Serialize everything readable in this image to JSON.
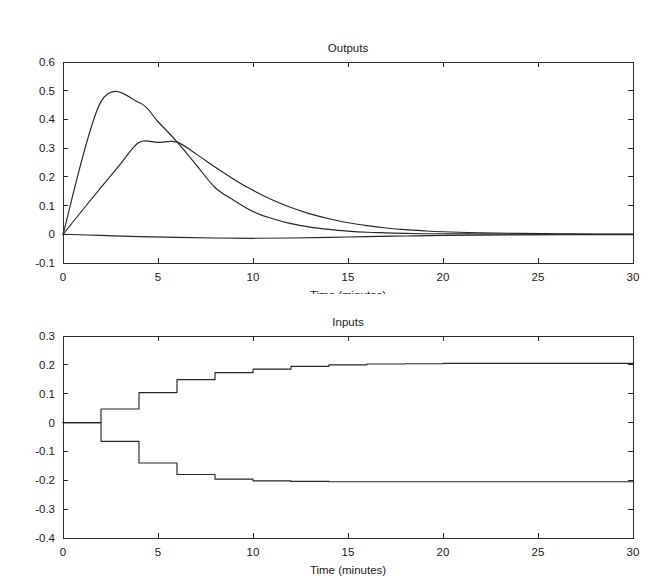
{
  "figure": {
    "width": 669,
    "height": 588,
    "background": "#ffffff",
    "line_color": "#262626",
    "axis_color": "#2a2a2a"
  },
  "chart_data": [
    {
      "type": "line",
      "id": "outputs",
      "title": "Outputs",
      "xlabel": "Time (minutes)",
      "ylabel": "",
      "xlim": [
        0,
        30
      ],
      "ylim": [
        -0.1,
        0.6
      ],
      "xticks": [
        0,
        5,
        10,
        15,
        20,
        25,
        30
      ],
      "xticklabels": [
        "0",
        "5",
        "10",
        "15",
        "20",
        "25",
        "30"
      ],
      "yticks": [
        -0.1,
        0,
        0.1,
        0.2,
        0.3,
        0.4,
        0.5,
        0.6
      ],
      "yticklabels": [
        "-0.1",
        "0",
        "0.1",
        "0.2",
        "0.3",
        "0.4",
        "0.5",
        "0.6"
      ],
      "grid": false,
      "legend": "none",
      "box": true,
      "series": [
        {
          "name": "output-1",
          "x": [
            0,
            2,
            4,
            5,
            6,
            7,
            8,
            9,
            10,
            11,
            12,
            13,
            14,
            15,
            16,
            17,
            18,
            19,
            20,
            22,
            24,
            26,
            28,
            30
          ],
          "y": [
            0.0,
            0.462,
            0.459,
            0.392,
            0.322,
            0.243,
            0.163,
            0.118,
            0.079,
            0.055,
            0.037,
            0.025,
            0.017,
            0.011,
            0.007,
            0.005,
            0.003,
            0.002,
            0.002,
            0.001,
            0.001,
            0.0,
            0.0,
            0.0
          ]
        },
        {
          "name": "output-2",
          "x": [
            0,
            1,
            2,
            3,
            4,
            5,
            6,
            7,
            8,
            9,
            10,
            11,
            12,
            13,
            14,
            15,
            16,
            17,
            18,
            19,
            20,
            22,
            24,
            26,
            28,
            30
          ],
          "y": [
            0.0,
            0.082,
            0.163,
            0.243,
            0.32,
            0.32,
            0.321,
            0.28,
            0.234,
            0.191,
            0.153,
            0.12,
            0.093,
            0.071,
            0.054,
            0.04,
            0.03,
            0.022,
            0.016,
            0.012,
            0.009,
            0.005,
            0.003,
            0.002,
            0.001,
            0.001
          ]
        },
        {
          "name": "output-3",
          "x": [
            0,
            2,
            4,
            6,
            8,
            10,
            12,
            14,
            16,
            18,
            20,
            24,
            30
          ],
          "y": [
            0.0,
            -0.004,
            -0.008,
            -0.011,
            -0.013,
            -0.014,
            -0.013,
            -0.011,
            -0.008,
            -0.006,
            -0.004,
            -0.002,
            -0.001
          ]
        }
      ]
    },
    {
      "type": "line",
      "id": "inputs",
      "title": "Inputs",
      "xlabel": "Time (minutes)",
      "ylabel": "",
      "xlim": [
        0,
        30
      ],
      "ylim": [
        -0.4,
        0.3
      ],
      "xticks": [
        0,
        5,
        10,
        15,
        20,
        25,
        30
      ],
      "xticklabels": [
        "0",
        "5",
        "10",
        "15",
        "20",
        "25",
        "30"
      ],
      "yticks": [
        -0.4,
        -0.3,
        -0.2,
        -0.1,
        0,
        0.1,
        0.2,
        0.3
      ],
      "yticklabels": [
        "-0.4",
        "-0.3",
        "-0.2",
        "-0.1",
        "0",
        "0.1",
        "0.2",
        "0.3"
      ],
      "grid": false,
      "legend": "none",
      "box": true,
      "drawstyle": "steps-post",
      "series": [
        {
          "name": "input-upper",
          "x": [
            0,
            2,
            4,
            6,
            8,
            10,
            12,
            14,
            16,
            18,
            20,
            22,
            24,
            26,
            28,
            30
          ],
          "y": [
            0.0,
            0.047,
            0.104,
            0.149,
            0.173,
            0.185,
            0.195,
            0.2,
            0.203,
            0.204,
            0.205,
            0.205,
            0.205,
            0.205,
            0.205,
            0.205
          ]
        },
        {
          "name": "input-lower",
          "x": [
            0,
            2,
            4,
            6,
            8,
            10,
            12,
            14,
            16,
            18,
            20,
            22,
            24,
            26,
            28,
            30
          ],
          "y": [
            0.0,
            -0.065,
            -0.14,
            -0.18,
            -0.196,
            -0.202,
            -0.204,
            -0.205,
            -0.205,
            -0.205,
            -0.205,
            -0.205,
            -0.205,
            -0.205,
            -0.205,
            -0.205
          ]
        }
      ]
    }
  ]
}
